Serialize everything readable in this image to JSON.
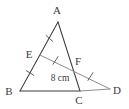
{
  "figure": {
    "background_color": "#ffffff",
    "line_color": "#3f3f41",
    "light_line_color": "#8d8d90",
    "label_color": "#3a3a3c",
    "width": 129,
    "height": 109
  },
  "points": {
    "A": {
      "label": "A",
      "x": 58,
      "y": 22,
      "label_x": 57,
      "label_y": 14
    },
    "B": {
      "label": "B",
      "x": 20,
      "y": 91,
      "label_x": 9,
      "label_y": 95
    },
    "C": {
      "label": "C",
      "x": 80,
      "y": 91,
      "label_x": 76,
      "label_y": 103
    },
    "D": {
      "label": "D",
      "x": 110,
      "y": 89,
      "label_x": 113,
      "label_y": 94
    },
    "E": {
      "label": "E",
      "x": 40,
      "y": 55,
      "label_x": 27,
      "label_y": 58
    },
    "F": {
      "label": "F",
      "x": 71,
      "y": 66,
      "label_x": 74,
      "label_y": 65
    }
  },
  "segments": [
    {
      "name": "AB",
      "from": "A",
      "to": "B",
      "style": "dark"
    },
    {
      "name": "AC",
      "from": "A",
      "to": "C",
      "style": "dark"
    },
    {
      "name": "BC",
      "from": "B",
      "to": "C",
      "style": "dark"
    },
    {
      "name": "CD",
      "from": "C",
      "to": "D",
      "style": "light"
    },
    {
      "name": "ED",
      "from": "E",
      "to": "D",
      "style": "light"
    }
  ],
  "tick_marks": [
    {
      "name": "tick-AE",
      "on_segment": "AE",
      "count": 1
    },
    {
      "name": "tick-EB",
      "on_segment": "EB",
      "count": 1
    },
    {
      "name": "tick-EF",
      "on_segment": "EF",
      "count": 1
    },
    {
      "name": "tick-FD",
      "on_segment": "FD",
      "count": 1
    }
  ],
  "measurements": [
    {
      "name": "length-EF",
      "text": "8 cm",
      "x": 60,
      "y": 80
    }
  ]
}
